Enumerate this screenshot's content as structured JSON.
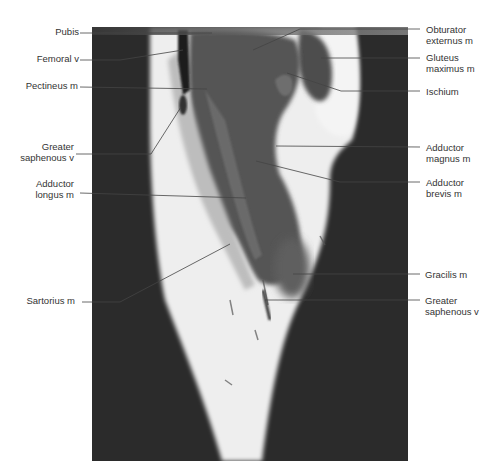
{
  "figure": {
    "type": "coronal MRI of thigh (T1-weighted)",
    "colors": {
      "background": "#2a2a2a",
      "fat": "#f2f2f2",
      "muscle": "#5a5a5a",
      "label_text": "#333333",
      "leader_line": "#444444"
    }
  },
  "labels_left": [
    {
      "id": "pubis",
      "text": "Pubis"
    },
    {
      "id": "femoral-v",
      "text": "Femoral v"
    },
    {
      "id": "pectineus-m",
      "text": "Pectineus m"
    },
    {
      "id": "greater-saphenous-v-upper",
      "text": "Greater\nsaphenous v"
    },
    {
      "id": "adductor-longus-m",
      "text": "Adductor\nlongus m"
    },
    {
      "id": "sartorius-m",
      "text": "Sartorius m"
    }
  ],
  "labels_right": [
    {
      "id": "obturator-externus-m",
      "text": "Obturator\nexternus m"
    },
    {
      "id": "gluteus-maximus-m",
      "text": "Gluteus\nmaximus m"
    },
    {
      "id": "ischium",
      "text": "Ischium"
    },
    {
      "id": "adductor-magnus-m",
      "text": "Adductor\nmagnus m"
    },
    {
      "id": "adductor-brevis-m",
      "text": "Adductor\nbrevis m"
    },
    {
      "id": "gracilis-m",
      "text": "Gracilis m"
    },
    {
      "id": "greater-saphenous-v-lower",
      "text": "Greater\nsaphenous v"
    }
  ]
}
